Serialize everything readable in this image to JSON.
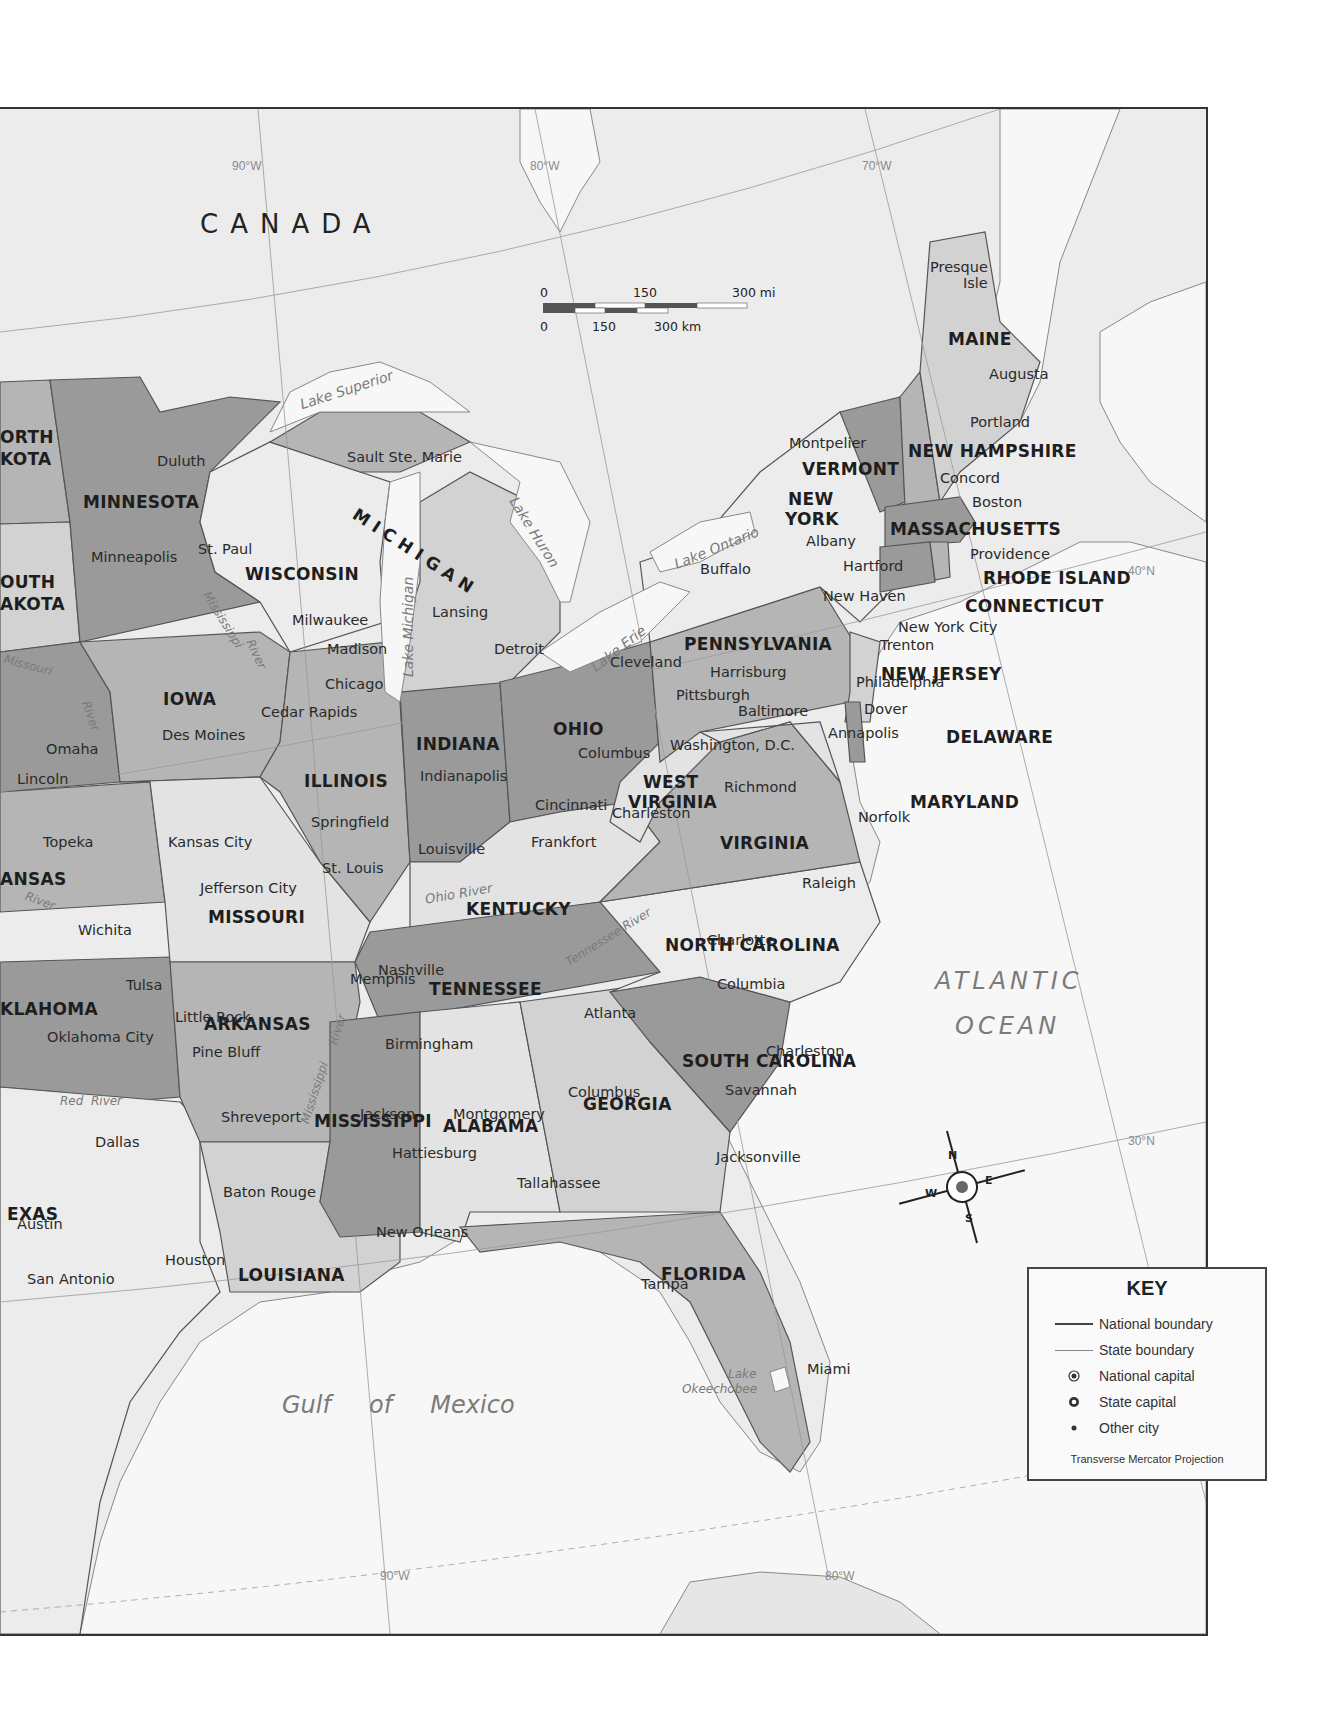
{
  "map": {
    "country_label": "CANADA",
    "ocean_labels": {
      "atlantic_line1": "ATLANTIC",
      "atlantic_line2": "OCEAN",
      "gulf": "Gulf     of     Mexico"
    },
    "grid_labels": {
      "lon_top": [
        "90°W",
        "80°W",
        "70°W"
      ],
      "lon_bottom": [
        "90°W",
        "80°W"
      ],
      "lat": [
        "40°N",
        "30°N"
      ]
    },
    "scale_bar": {
      "miles": {
        "ticks": [
          "0",
          "150",
          "300 mi"
        ]
      },
      "km": {
        "ticks": [
          "0",
          "150",
          "300 km"
        ]
      }
    },
    "compass": {
      "n": "N",
      "s": "S",
      "e": "E",
      "w": "W"
    },
    "states": {
      "north_dakota": "ORTH\nKOTA",
      "north_dakota_l1": "ORTH",
      "north_dakota_l2": "KOTA",
      "south_dakota_l1": "OUTH",
      "south_dakota_l2": "AKOTA",
      "minnesota": "MINNESOTA",
      "wisconsin": "WISCONSIN",
      "michigan": "MICHIGAN",
      "iowa": "IOWA",
      "illinois": "ILLINOIS",
      "indiana": "INDIANA",
      "ohio": "OHIO",
      "pennsylvania": "PENNSYLVANIA",
      "new_york_l1": "NEW",
      "new_york_l2": "YORK",
      "vermont": "VERMONT",
      "new_hampshire": "NEW HAMPSHIRE",
      "maine": "MAINE",
      "massachusetts": "MASSACHUSETTS",
      "rhode_island": "RHODE ISLAND",
      "connecticut": "CONNECTICUT",
      "new_jersey": "NEW JERSEY",
      "delaware": "DELAWARE",
      "maryland": "MARYLAND",
      "west_virginia_l1": "WEST",
      "west_virginia_l2": "VIRGINIA",
      "virginia": "VIRGINIA",
      "kentucky": "KENTUCKY",
      "tennessee": "TENNESSEE",
      "north_carolina": "NORTH CAROLINA",
      "south_carolina": "SOUTH CAROLINA",
      "georgia": "GEORGIA",
      "alabama": "ALABAMA",
      "mississippi": "MISSISSIPPI",
      "louisiana": "LOUISIANA",
      "arkansas": "ARKANSAS",
      "missouri": "MISSOURI",
      "kansas": "ANSAS",
      "oklahoma": "KLAHOMA",
      "texas": "EXAS",
      "florida": "FLORIDA"
    },
    "cities": {
      "presque_isle_l1": "Presque",
      "presque_isle_l2": "Isle",
      "augusta": "Augusta",
      "portland": "Portland",
      "montpelier": "Montpelier",
      "concord": "Concord",
      "boston": "Boston",
      "albany": "Albany",
      "providence": "Providence",
      "hartford": "Hartford",
      "new_haven": "New Haven",
      "new_york_city": "New York City",
      "trenton": "Trenton",
      "philadelphia": "Philadelphia",
      "dover": "Dover",
      "baltimore": "Baltimore",
      "annapolis": "Annapolis",
      "washington_dc": "Washington, D.C.",
      "richmond": "Richmond",
      "norfolk": "Norfolk",
      "charleston_wv": "Charleston",
      "raleigh": "Raleigh",
      "charlotte": "Charlotte",
      "columbia": "Columbia",
      "charleston_sc": "Charleston",
      "savannah": "Savannah",
      "atlanta": "Atlanta",
      "columbus_ga": "Columbus",
      "jacksonville": "Jacksonville",
      "tallahassee": "Tallahassee",
      "tampa": "Tampa",
      "miami": "Miami",
      "montgomery": "Montgomery",
      "birmingham": "Birmingham",
      "jackson": "Jackson",
      "hattiesburg": "Hattiesburg",
      "baton_rouge": "Baton Rouge",
      "new_orleans": "New Orleans",
      "shreveport": "Shreveport",
      "little_rock": "Little Rock",
      "pine_bluff": "Pine Bluff",
      "memphis": "Memphis",
      "nashville": "Nashville",
      "louisville": "Louisville",
      "frankfort": "Frankfort",
      "cincinnati": "Cincinnati",
      "columbus_oh": "Columbus",
      "cleveland": "Cleveland",
      "pittsburgh": "Pittsburgh",
      "harrisburg": "Harrisburg",
      "buffalo": "Buffalo",
      "detroit": "Detroit",
      "lansing": "Lansing",
      "sault_ste_marie": "Sault Ste. Marie",
      "chicago": "Chicago",
      "milwaukee": "Milwaukee",
      "madison": "Madison",
      "springfield": "Springfield",
      "st_louis": "St. Louis",
      "indianapolis": "Indianapolis",
      "jefferson_city": "Jefferson City",
      "kansas_city": "Kansas City",
      "topeka": "Topeka",
      "wichita": "Wichita",
      "tulsa": "Tulsa",
      "oklahoma_city": "Oklahoma City",
      "dallas": "Dallas",
      "austin": "Austin",
      "houston": "Houston",
      "san_antonio": "San Antonio",
      "omaha": "Omaha",
      "lincoln": "Lincoln",
      "des_moines": "Des Moines",
      "cedar_rapids": "Cedar Rapids",
      "minneapolis": "Minneapolis",
      "st_paul": "St. Paul",
      "duluth": "Duluth"
    },
    "water": {
      "lake_superior": "Lake Superior",
      "lake_michigan": "Lake Michigan",
      "lake_huron": "Lake Huron",
      "lake_erie": "Lake Erie",
      "lake_ontario": "Lake Ontario",
      "lake_okeechobee_l1": "Lake",
      "lake_okeechobee_l2": "Okeechobee",
      "mississippi_river_upper": "Mississippi",
      "river_upper": "River",
      "missouri_river": "Missouri",
      "missouri_river_2": "River",
      "ohio_river": "Ohio River",
      "tennessee_river": "Tennessee River",
      "mississippi_river_lower": "Mississippi",
      "river_lower": "River",
      "red_river": "Red  River",
      "kansas_river": "River"
    }
  },
  "key": {
    "title": "KEY",
    "items": [
      {
        "symbol": "line-thick",
        "label": "National boundary"
      },
      {
        "symbol": "line-thin",
        "label": "State boundary"
      },
      {
        "symbol": "national-capital",
        "label": "National capital"
      },
      {
        "symbol": "state-capital",
        "label": "State capital"
      },
      {
        "symbol": "dot",
        "label": "Other city"
      }
    ],
    "projection": "Transverse Mercator Projection"
  },
  "colors": {
    "background": "#f4f4f4",
    "water": "#f6f6f6",
    "canada": "#ececec",
    "state_dark": "#9a9a9a",
    "state_mid": "#b5b5b5",
    "state_light": "#d2d2d2",
    "state_pale": "#e3e3e3"
  }
}
